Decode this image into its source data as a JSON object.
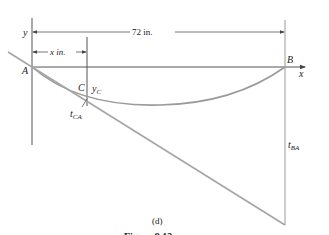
{
  "figure": {
    "panel_label": "(d)",
    "caption_partial": "Figure 9.13",
    "colors": {
      "axis": "#555555",
      "curve": "#9a9a9a",
      "tangent": "#a5a5a5",
      "text": "#222222"
    }
  },
  "labels": {
    "y_axis": "y",
    "x_axis": "x",
    "point_a": "A",
    "point_b": "B",
    "point_c": "C",
    "dim_total": "72 in.",
    "dim_x": "x in.",
    "y_c": "y",
    "y_c_sub": "C",
    "t_ca": "t",
    "t_ca_sub": "CA",
    "t_ba": "t",
    "t_ba_sub": "BA"
  }
}
